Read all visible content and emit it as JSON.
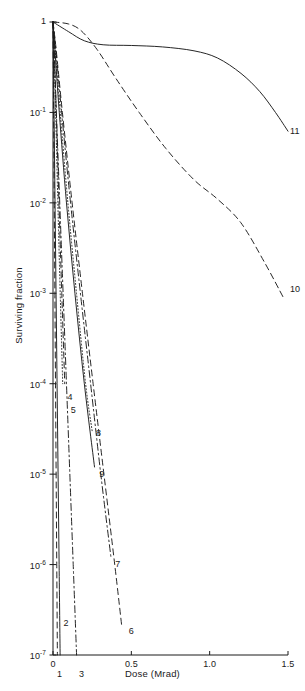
{
  "chart_data": {
    "type": "line",
    "title": "",
    "xlabel": "Dose (Mrad)",
    "ylabel": "Surviving fraction",
    "xlim": [
      0,
      1.5
    ],
    "ylim": [
      1e-07,
      1
    ],
    "yscale": "log",
    "xscale": "linear",
    "grid": false,
    "legend": "inline-end-labels",
    "xticks": [
      "0",
      "0.5",
      "1.0",
      "1.5"
    ],
    "xtick_values": [
      0,
      0.5,
      1.0,
      1.5
    ],
    "yticks": [
      "1",
      "10-1",
      "10-2",
      "10-3",
      "10-4",
      "10-5",
      "10-6",
      "10-7"
    ],
    "ytick_values": [
      1,
      0.1,
      0.01,
      0.001,
      0.0001,
      1e-05,
      1e-06,
      1e-07
    ],
    "series": [
      {
        "name": "1",
        "label": "1",
        "style": "dashed",
        "points": [
          [
            0.0,
            1
          ],
          [
            0.004,
            0.1
          ],
          [
            0.008,
            0.01
          ],
          [
            0.012,
            0.001
          ],
          [
            0.016,
            0.0001
          ],
          [
            0.02,
            1e-05
          ],
          [
            0.024,
            1e-06
          ],
          [
            0.028,
            1e-07
          ]
        ]
      },
      {
        "name": "2",
        "label": "2",
        "style": "solid",
        "points": [
          [
            0.0,
            1
          ],
          [
            0.0065,
            0.1
          ],
          [
            0.013,
            0.01
          ],
          [
            0.0195,
            0.001
          ],
          [
            0.026,
            0.0001
          ],
          [
            0.0325,
            1e-05
          ],
          [
            0.039,
            1e-06
          ],
          [
            0.0455,
            1e-07
          ]
        ]
      },
      {
        "name": "3",
        "label": "3",
        "style": "dashdot",
        "points": [
          [
            0.0,
            1
          ],
          [
            0.0215,
            0.1
          ],
          [
            0.043,
            0.01
          ],
          [
            0.0645,
            0.001
          ],
          [
            0.086,
            0.0001
          ],
          [
            0.1075,
            1e-05
          ],
          [
            0.129,
            1e-06
          ],
          [
            0.1505,
            1e-07
          ]
        ]
      },
      {
        "name": "4",
        "label": "4",
        "style": "dotted",
        "points": [
          [
            0.0,
            1
          ],
          [
            0.006,
            0.5
          ],
          [
            0.017,
            0.1
          ],
          [
            0.031,
            0.01
          ],
          [
            0.046,
            0.001
          ],
          [
            0.062,
            0.0001
          ]
        ]
      },
      {
        "name": "5",
        "label": "5",
        "style": "dashed",
        "points": [
          [
            0.0,
            1
          ],
          [
            0.008,
            0.5
          ],
          [
            0.021,
            0.1
          ],
          [
            0.038,
            0.01
          ],
          [
            0.056,
            0.001
          ],
          [
            0.075,
            0.0001
          ]
        ]
      },
      {
        "name": "6",
        "label": "6",
        "style": "dashed",
        "points": [
          [
            0.0,
            1
          ],
          [
            0.02,
            0.5
          ],
          [
            0.06,
            0.1
          ],
          [
            0.122,
            0.01
          ],
          [
            0.188,
            0.001
          ],
          [
            0.256,
            0.0001
          ],
          [
            0.325,
            1e-05
          ],
          [
            0.394,
            1e-06
          ],
          [
            0.44,
            2e-07
          ]
        ]
      },
      {
        "name": "7",
        "label": "7",
        "style": "dashdot",
        "points": [
          [
            0.0,
            1
          ],
          [
            0.018,
            0.5
          ],
          [
            0.055,
            0.1
          ],
          [
            0.112,
            0.01
          ],
          [
            0.175,
            0.001
          ],
          [
            0.24,
            0.0001
          ],
          [
            0.305,
            1e-05
          ],
          [
            0.37,
            1.2e-06
          ]
        ]
      },
      {
        "name": "8",
        "label": "8",
        "style": "dotted",
        "points": [
          [
            0.0,
            1
          ],
          [
            0.014,
            0.5
          ],
          [
            0.046,
            0.1
          ],
          [
            0.095,
            0.01
          ],
          [
            0.15,
            0.001
          ],
          [
            0.208,
            0.0001
          ],
          [
            0.25,
            3e-05
          ]
        ]
      },
      {
        "name": "9",
        "label": "9",
        "style": "solid",
        "points": [
          [
            0.0,
            1
          ],
          [
            0.012,
            0.5
          ],
          [
            0.04,
            0.1
          ],
          [
            0.086,
            0.01
          ],
          [
            0.14,
            0.001
          ],
          [
            0.2,
            0.0001
          ],
          [
            0.265,
            1.2e-05
          ]
        ]
      },
      {
        "name": "10",
        "label": "10",
        "style": "dashed",
        "points": [
          [
            0.0,
            1
          ],
          [
            0.1,
            0.95
          ],
          [
            0.18,
            0.8
          ],
          [
            0.28,
            0.5
          ],
          [
            0.4,
            0.24
          ],
          [
            0.55,
            0.1
          ],
          [
            0.72,
            0.04
          ],
          [
            0.9,
            0.018
          ],
          [
            1.05,
            0.011
          ],
          [
            1.2,
            0.006
          ],
          [
            1.35,
            0.0022
          ],
          [
            1.47,
            0.0009
          ]
        ]
      },
      {
        "name": "11",
        "label": "11",
        "style": "solid",
        "points": [
          [
            0.0,
            1
          ],
          [
            0.1,
            0.78
          ],
          [
            0.2,
            0.62
          ],
          [
            0.32,
            0.56
          ],
          [
            0.5,
            0.55
          ],
          [
            0.7,
            0.53
          ],
          [
            0.9,
            0.48
          ],
          [
            1.05,
            0.4
          ],
          [
            1.2,
            0.27
          ],
          [
            1.32,
            0.17
          ],
          [
            1.42,
            0.1
          ],
          [
            1.5,
            0.062
          ]
        ]
      }
    ],
    "curve_labels": [
      {
        "text": "1",
        "x": 0.012,
        "y": 6e-08
      },
      {
        "text": "2",
        "x": 0.055,
        "y": 2.2e-07
      },
      {
        "text": "3",
        "x": 0.153,
        "y": 6e-08
      },
      {
        "text": "4",
        "x": 0.08,
        "y": 7e-05
      },
      {
        "text": "5",
        "x": 0.1,
        "y": 5e-05
      },
      {
        "text": "6",
        "x": 0.47,
        "y": 1.8e-07
      },
      {
        "text": "7",
        "x": 0.385,
        "y": 1e-06
      },
      {
        "text": "8",
        "x": 0.262,
        "y": 2.8e-05
      },
      {
        "text": "9",
        "x": 0.283,
        "y": 9.8e-06
      },
      {
        "text": "10",
        "x": 1.5,
        "y": 0.0011
      },
      {
        "text": "11",
        "x": 1.5,
        "y": 0.06
      }
    ]
  },
  "axis": {
    "xlabel": "Dose (Mrad)",
    "ylabel": "Surviving fraction",
    "xtick_labels": [
      "0",
      "0.5",
      "1.0",
      "1.5"
    ],
    "ytick_mantissa": [
      "1",
      "10",
      "10",
      "10",
      "10",
      "10",
      "10",
      "10"
    ],
    "ytick_exponent": [
      "",
      "-1",
      "-2",
      "-3",
      "-4",
      "-5",
      "-6",
      "-7"
    ]
  },
  "style": {
    "line_color": "#1a1a1a",
    "axis_color": "#1a1a1a",
    "background": "#ffffff"
  }
}
